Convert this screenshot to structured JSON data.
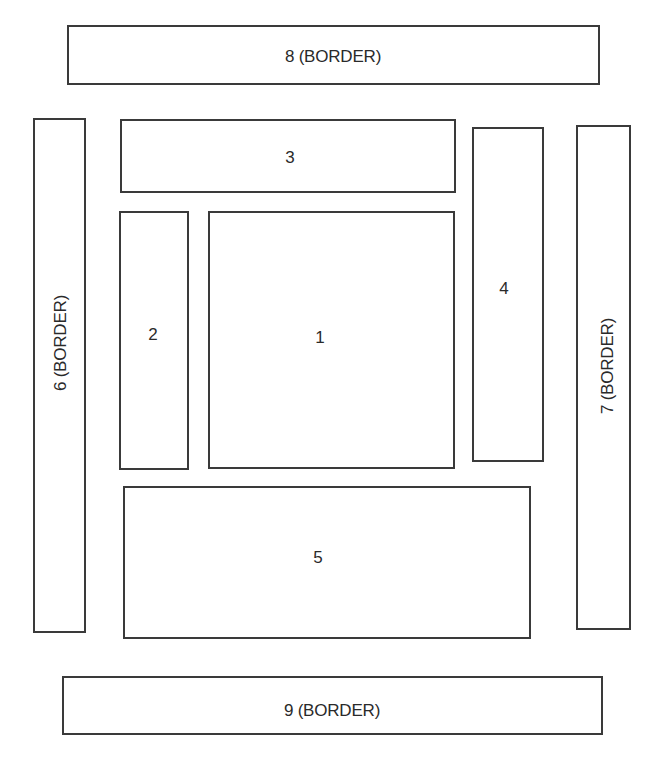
{
  "diagram": {
    "type": "layout-regions",
    "line_color": "#3a3a3a",
    "background": "#ffffff",
    "regions": [
      {
        "id": "1",
        "label": "1",
        "x": 208,
        "y": 211,
        "w": 247,
        "h": 258,
        "label_x": 320,
        "label_y": 337,
        "vertical": false
      },
      {
        "id": "2",
        "label": "2",
        "x": 119,
        "y": 211,
        "w": 70,
        "h": 259,
        "label_x": 153,
        "label_y": 334,
        "vertical": false
      },
      {
        "id": "3",
        "label": "3",
        "x": 120,
        "y": 119,
        "w": 336,
        "h": 74,
        "label_x": 290,
        "label_y": 157,
        "vertical": false
      },
      {
        "id": "4",
        "label": "4",
        "x": 472,
        "y": 127,
        "w": 72,
        "h": 335,
        "label_x": 504,
        "label_y": 288,
        "vertical": false
      },
      {
        "id": "5",
        "label": "5",
        "x": 123,
        "y": 486,
        "w": 408,
        "h": 153,
        "label_x": 318,
        "label_y": 557,
        "vertical": false
      },
      {
        "id": "6",
        "label": "6 (BORDER)",
        "x": 33,
        "y": 118,
        "w": 53,
        "h": 515,
        "label_x": 60,
        "label_y": 343,
        "vertical": true
      },
      {
        "id": "7",
        "label": "7 (BORDER)",
        "x": 576,
        "y": 125,
        "w": 55,
        "h": 505,
        "label_x": 607,
        "label_y": 366,
        "vertical": true
      },
      {
        "id": "8",
        "label": "8 (BORDER)",
        "x": 67,
        "y": 25,
        "w": 533,
        "h": 60,
        "label_x": 333,
        "label_y": 56,
        "vertical": false
      },
      {
        "id": "9",
        "label": "9 (BORDER)",
        "x": 62,
        "y": 676,
        "w": 541,
        "h": 59,
        "label_x": 332,
        "label_y": 710,
        "vertical": false
      }
    ]
  }
}
